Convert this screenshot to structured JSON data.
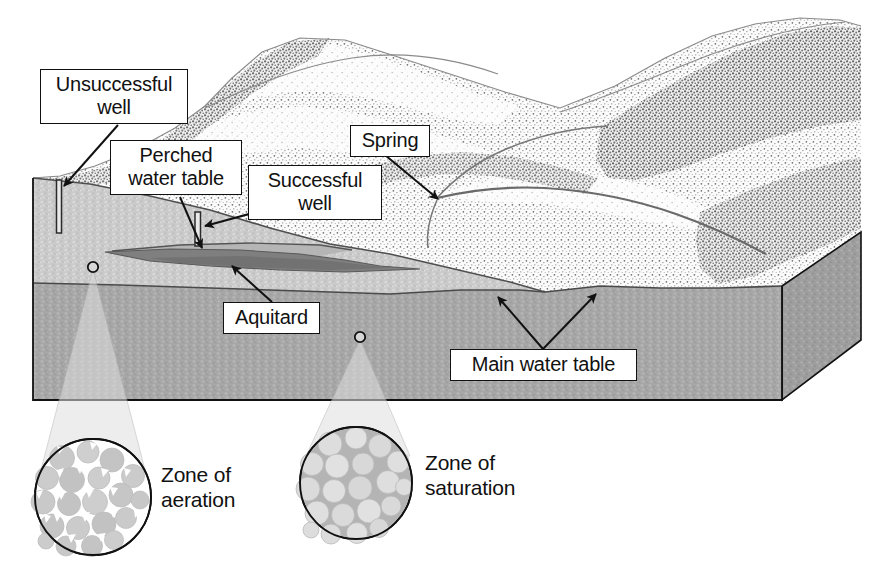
{
  "labels": {
    "unsuccessful_well": "Unsuccessful\nwell",
    "perched_water_table": "Perched\nwater table",
    "successful_well": "Successful\nwell",
    "spring": "Spring",
    "aquitard": "Aquitard",
    "main_water_table": "Main water table"
  },
  "callouts": {
    "zone_of_aeration": "Zone of\naeration",
    "zone_of_saturation": "Zone of\nsaturation"
  },
  "colors": {
    "ink": "#111111",
    "box_fill": "#ffffff",
    "unsaturated_rock": "#c9c9c9",
    "saturated_rock": "#a6a6a6",
    "aquitard": "#8a8a8a",
    "side_face": "#9d9d9d",
    "terrain_light": "#f4f4f4",
    "terrain_mid": "#cfcfcf",
    "terrain_dark": "#8f8f8f",
    "cone_fill": "#e8e8e8",
    "grain_aeration": "#c4c4c4",
    "grain_saturation": "#d8d8d8",
    "pore_air": "#ffffff",
    "pore_water": "#b0b0b0"
  },
  "geometry": {
    "block": {
      "left_x": 33,
      "right_x": 782,
      "bottom_y": 400,
      "front_top_left_y": 178,
      "side_far_x": 861
    },
    "water_table_left_y": 283,
    "aquitard_lens": {
      "x_start": 105,
      "x_end": 345,
      "y_top": 247,
      "y_bottom": 266
    },
    "wells": [
      {
        "name": "unsuccessful",
        "x": 58,
        "y_top": 180,
        "y_bottom": 233
      },
      {
        "name": "successful",
        "x": 197,
        "y_top": 212,
        "y_bottom": 246
      }
    ],
    "cones": [
      {
        "name": "aeration",
        "apex_x": 93,
        "apex_y": 267,
        "circle_cx": 93,
        "circle_cy": 497,
        "circle_r": 58
      },
      {
        "name": "saturation",
        "apex_x": 360,
        "apex_y": 337,
        "circle_cx": 356,
        "circle_cy": 483,
        "circle_r": 56
      }
    ],
    "spring_point": {
      "x": 437,
      "y": 198
    }
  }
}
